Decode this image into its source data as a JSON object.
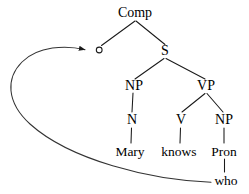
{
  "diagram": {
    "type": "syntax-tree",
    "sentence": "Mary knows who",
    "colors": {
      "ink": "#1a1a1a",
      "background": "#ffffff"
    },
    "nodes": {
      "comp": {
        "label": "Comp",
        "x": 135,
        "y": 13
      },
      "trace_site": {
        "label": "o",
        "x": 99,
        "y": 50
      },
      "s": {
        "label": "S",
        "x": 165,
        "y": 51
      },
      "np_subject": {
        "label": "NP",
        "x": 134,
        "y": 86
      },
      "vp": {
        "label": "VP",
        "x": 206,
        "y": 86
      },
      "n": {
        "label": "N",
        "x": 132,
        "y": 120
      },
      "v": {
        "label": "V",
        "x": 181,
        "y": 120
      },
      "np_object": {
        "label": "NP",
        "x": 224,
        "y": 120
      },
      "mary": {
        "label": "Mary",
        "x": 130,
        "y": 152
      },
      "knows": {
        "label": "knows",
        "x": 179,
        "y": 152
      },
      "pron": {
        "label": "Pron",
        "x": 224,
        "y": 152
      },
      "who": {
        "label": "who",
        "x": 226,
        "y": 181
      }
    },
    "edges": [
      {
        "name": "comp-to-trace",
        "from": "comp",
        "to": "trace_site"
      },
      {
        "name": "comp-to-s",
        "from": "comp",
        "to": "s"
      },
      {
        "name": "s-to-np-subject",
        "from": "s",
        "to": "np_subject"
      },
      {
        "name": "s-to-vp",
        "from": "s",
        "to": "vp"
      },
      {
        "name": "np-subject-to-n",
        "from": "np_subject",
        "to": "n"
      },
      {
        "name": "vp-to-v",
        "from": "vp",
        "to": "v"
      },
      {
        "name": "vp-to-np-object",
        "from": "vp",
        "to": "np_object"
      },
      {
        "name": "n-to-mary",
        "from": "n",
        "to": "mary"
      },
      {
        "name": "v-to-knows",
        "from": "v",
        "to": "knows"
      },
      {
        "name": "np-object-to-pron",
        "from": "np_object",
        "to": "pron"
      },
      {
        "name": "pron-to-who",
        "from": "pron",
        "to": "who"
      }
    ],
    "movement_arrow": {
      "name": "wh-movement-arc",
      "from": "who",
      "to": "trace_site",
      "arrowhead": "filled-triangle"
    }
  }
}
